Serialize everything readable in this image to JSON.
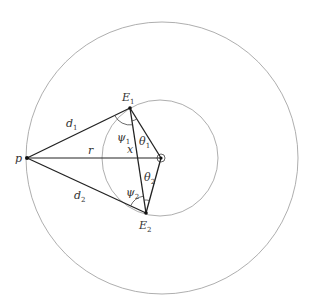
{
  "diagram": {
    "type": "geometry",
    "points": {
      "p": {
        "label": "p",
        "x": 27,
        "y": 158
      },
      "O": {
        "label": "",
        "x": 161,
        "y": 158
      },
      "E1": {
        "label": "E",
        "sub": "1",
        "x": 130,
        "y": 108
      },
      "E2": {
        "label": "E",
        "sub": "2",
        "x": 146,
        "y": 213
      }
    },
    "circles": {
      "outer": {
        "cx": 162,
        "cy": 158,
        "r": 136
      },
      "inner": {
        "cx": 160,
        "cy": 158,
        "r": 58
      }
    },
    "segment_labels": {
      "d1": {
        "text": "d",
        "sub": "1"
      },
      "d2": {
        "text": "d",
        "sub": "2"
      },
      "r": {
        "text": "r"
      },
      "x": {
        "text": "x"
      }
    },
    "angle_labels": {
      "psi1": {
        "text": "ψ",
        "sub": "1"
      },
      "psi2": {
        "text": "ψ",
        "sub": "2"
      },
      "theta1": {
        "text": "θ",
        "sub": "1"
      },
      "theta2": {
        "text": "θ",
        "sub": "2"
      }
    },
    "colors": {
      "line": "#222222",
      "circle": "#888888",
      "text": "#333333"
    }
  }
}
